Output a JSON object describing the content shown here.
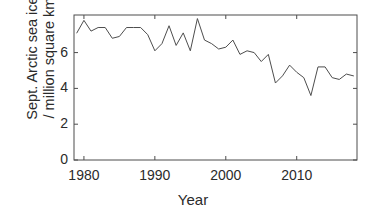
{
  "chart_data": {
    "type": "line",
    "title": "",
    "xlabel": "Year",
    "ylabel": "Sept. Arctic sea ice / million square km",
    "ylabel_lines": [
      "Sept. Arctic sea ice",
      "/ million square km"
    ],
    "xlim": [
      1978.6,
      2018.5
    ],
    "ylim": [
      0,
      8.1
    ],
    "xticks": [
      1980,
      1990,
      2000,
      2010
    ],
    "xtick_labels": [
      "1980",
      "1990",
      "2000",
      "2010"
    ],
    "yticks": [
      0,
      2,
      4,
      6
    ],
    "ytick_labels": [
      "0",
      "2",
      "4",
      "6"
    ],
    "grid": false,
    "legend": "none",
    "line_color": "#4d4d4d",
    "axis_color": "#4d4d4d",
    "x": [
      1979,
      1980,
      1981,
      1982,
      1983,
      1984,
      1985,
      1986,
      1987,
      1988,
      1989,
      1990,
      1991,
      1992,
      1993,
      1994,
      1995,
      1996,
      1997,
      1998,
      1999,
      2000,
      2001,
      2002,
      2003,
      2004,
      2005,
      2006,
      2007,
      2008,
      2009,
      2010,
      2011,
      2012,
      2013,
      2014,
      2015,
      2016,
      2017,
      2018
    ],
    "values": [
      7.1,
      7.8,
      7.2,
      7.4,
      7.4,
      6.8,
      6.9,
      7.4,
      7.4,
      7.4,
      7.0,
      6.1,
      6.5,
      7.5,
      6.4,
      7.1,
      6.1,
      7.9,
      6.7,
      6.5,
      6.2,
      6.3,
      6.7,
      5.9,
      6.1,
      6.0,
      5.5,
      5.9,
      4.3,
      4.7,
      5.3,
      4.9,
      4.6,
      3.6,
      5.2,
      5.2,
      4.6,
      4.5,
      4.8,
      4.7
    ],
    "series_name": "September Arctic sea ice extent"
  },
  "axes": {
    "xlabel": "Year",
    "ytick_0": "0",
    "ytick_1": "2",
    "ytick_2": "4",
    "ytick_3": "6",
    "xtick_0": "1980",
    "xtick_1": "1990",
    "xtick_2": "2000",
    "xtick_3": "2010",
    "ylabel_line_1": "Sept. Arctic sea ice",
    "ylabel_line_2": "/ million square km"
  }
}
